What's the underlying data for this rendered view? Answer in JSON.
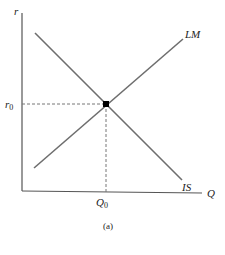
{
  "diagram": {
    "type": "IS-LM",
    "caption": "(a)",
    "axes": {
      "y_label": "r",
      "x_label": "Q"
    },
    "curves": [
      {
        "name": "LM",
        "label": "LM",
        "slope": "upward",
        "color": "#6e6e6e"
      },
      {
        "name": "IS",
        "label": "IS",
        "slope": "downward",
        "color": "#6e6e6e"
      }
    ],
    "equilibrium": {
      "r_label": "r",
      "r_subscript": "0",
      "q_label": "Q",
      "q_subscript": "0"
    },
    "colors": {
      "axis": "#555555",
      "curve": "#6e6e6e",
      "dashed": "#777777",
      "point": "#000000",
      "text": "#222222"
    }
  }
}
